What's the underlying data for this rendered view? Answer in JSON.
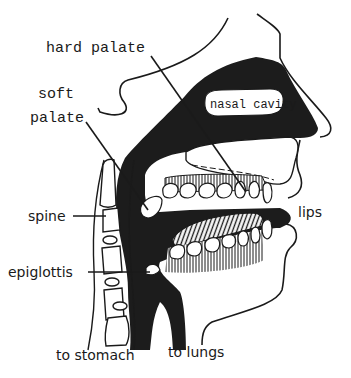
{
  "diagram": {
    "colors": {
      "ink": "#1a1a1a",
      "paper": "#ffffff",
      "cavity_fill": "#1c1c1c"
    },
    "labels": {
      "hard_palate": "hard palate",
      "soft_palate_line1": "soft",
      "soft_palate_line2": "palate",
      "nasal_cavity": "nasal cavity",
      "spine": "spine",
      "lips": "lips",
      "epiglottis": "epiglottis",
      "to_stomach": "to stomach",
      "to_lungs": "to lungs"
    }
  }
}
